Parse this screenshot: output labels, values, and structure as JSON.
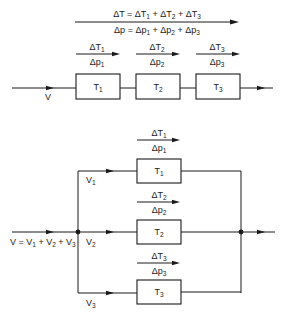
{
  "series": {
    "title": "Series connection",
    "total_delta_T": {
      "lhs": "ΔT",
      "terms": [
        "ΔT",
        "ΔT",
        "ΔT"
      ],
      "subs": [
        "1",
        "2",
        "3"
      ],
      "text": "ΔT = ΔT1 + ΔT2 + ΔT3"
    },
    "total_delta_p": {
      "lhs": "Δp",
      "terms": [
        "Δp",
        "Δp",
        "Δp"
      ],
      "subs": [
        "1",
        "2",
        "3"
      ],
      "text": "Δp = Δp1 + Δp2 + Δp3"
    },
    "flow_label": "V",
    "elements": [
      {
        "name": "T",
        "sub": "1",
        "dT": "ΔT",
        "dp": "Δp"
      },
      {
        "name": "T",
        "sub": "2",
        "dT": "ΔT",
        "dp": "Δp"
      },
      {
        "name": "T",
        "sub": "3",
        "dT": "ΔT",
        "dp": "Δp"
      }
    ]
  },
  "parallel": {
    "title": "Parallel connection",
    "flow_total": {
      "text": "V = V1 + V2 + V3",
      "lhs": "V",
      "terms": [
        "V",
        "V",
        "V"
      ],
      "subs": [
        "1",
        "2",
        "3"
      ]
    },
    "branches": [
      {
        "flow": "V",
        "sub": "1",
        "name": "T",
        "dT": "ΔT",
        "dp": "Δp"
      },
      {
        "flow": "V",
        "sub": "2",
        "name": "T",
        "dT": "ΔT",
        "dp": "Δp"
      },
      {
        "flow": "V",
        "sub": "3",
        "name": "T",
        "dT": "ΔT",
        "dp": "Δp"
      }
    ]
  },
  "colors": {
    "ink": "#1a1a1a",
    "background": "#ffffff"
  }
}
